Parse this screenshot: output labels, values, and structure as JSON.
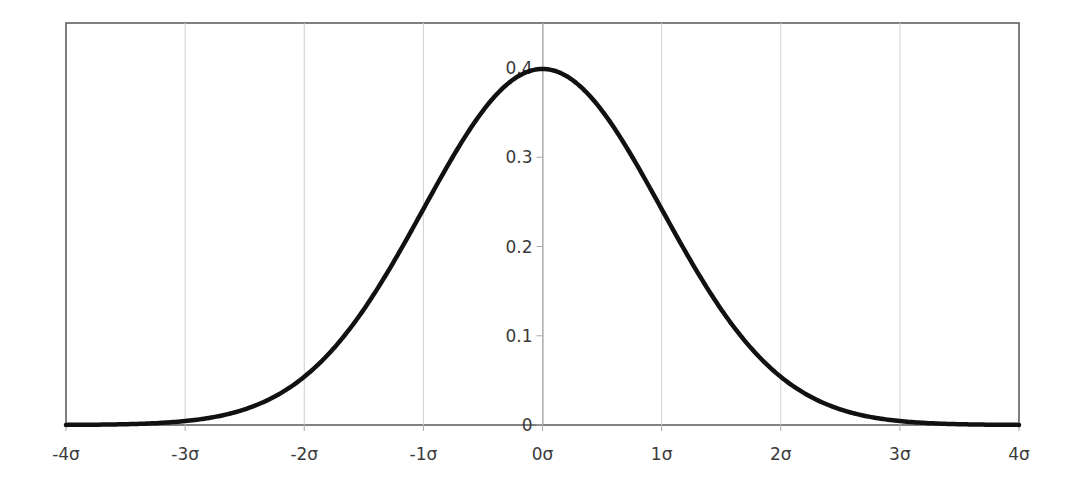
{
  "chart_data": {
    "type": "line",
    "title": "",
    "xlabel": "",
    "ylabel": "",
    "series": [
      {
        "name": "Standard normal probability density",
        "x": [
          -4,
          -3.5,
          -3,
          -2.5,
          -2,
          -1.5,
          -1,
          -0.5,
          0,
          0.5,
          1,
          1.5,
          2,
          2.5,
          3,
          3.5,
          4
        ],
        "values": [
          0.0001,
          0.0009,
          0.0044,
          0.0175,
          0.054,
          0.1295,
          0.242,
          0.3521,
          0.3989,
          0.3521,
          0.242,
          0.1295,
          0.054,
          0.0175,
          0.0044,
          0.0009,
          0.0001
        ]
      }
    ],
    "x_ticks": [
      "-4σ",
      "-3σ",
      "-2σ",
      "-1σ",
      "0σ",
      "1σ",
      "2σ",
      "3σ",
      "4σ"
    ],
    "y_ticks": [
      "0",
      "0.1",
      "0.2",
      "0.3",
      "0.4"
    ],
    "xlim": [
      -4,
      4
    ],
    "ylim": [
      0,
      0.4
    ],
    "grid": {
      "vertical": true,
      "horizontal": false
    },
    "legend": null,
    "line_color": "#111111",
    "grid_color": "#d0d0d0"
  }
}
